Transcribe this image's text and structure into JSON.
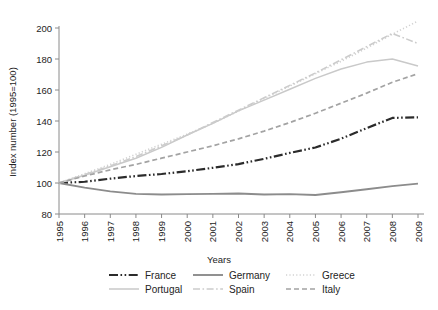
{
  "chart_data": {
    "type": "line",
    "title": "",
    "xlabel": "Years",
    "ylabel": "Index number (1995=100)",
    "x": [
      1995,
      1996,
      1997,
      1998,
      1999,
      2000,
      2001,
      2002,
      2003,
      2004,
      2005,
      2006,
      2007,
      2008,
      2009
    ],
    "xtick_labels": [
      "1995",
      "1996",
      "1997",
      "1998",
      "1999",
      "2000",
      "2001",
      "2002",
      "2003",
      "2004",
      "2005",
      "2006",
      "2007",
      "2008",
      "2009"
    ],
    "ytick_labels": [
      "80",
      "100",
      "120",
      "140",
      "160",
      "180",
      "200"
    ],
    "yticks": [
      80,
      100,
      120,
      140,
      160,
      180,
      200
    ],
    "xlim": [
      1995,
      2009
    ],
    "ylim": [
      80,
      206
    ],
    "grid": false,
    "legend_position": "bottom",
    "series": [
      {
        "name": "France",
        "color": "#2b2b2b",
        "width": 2.2,
        "dash": "9,2.5,1.6,2.5,1.6,2.5",
        "values": [
          100,
          100.8,
          102.8,
          104.5,
          105.8,
          107.6,
          109.8,
          112.2,
          115.6,
          119.4,
          122.9,
          128.6,
          135.4,
          142.0,
          142.4
        ]
      },
      {
        "name": "Germany",
        "color": "#8c8c8c",
        "width": 1.9,
        "dash": "",
        "values": [
          100,
          97.0,
          94.6,
          93.0,
          92.6,
          92.8,
          93.0,
          93.2,
          92.6,
          92.8,
          92.3,
          94.0,
          96.0,
          98.0,
          99.6
        ]
      },
      {
        "name": "Greece",
        "color": "#d2d2d2",
        "width": 1.6,
        "dash": "1.2,2.2",
        "values": [
          100,
          106.0,
          112.0,
          118.5,
          125.0,
          131.5,
          138.5,
          146.5,
          154.5,
          162.5,
          170.5,
          178.5,
          187.0,
          196.0,
          204.5
        ]
      },
      {
        "name": "Portugal",
        "color": "#c9c9c9",
        "width": 1.5,
        "dash": "",
        "values": [
          100,
          105.0,
          110.5,
          116.0,
          123.0,
          131.0,
          138.5,
          146.5,
          153.5,
          160.5,
          167.5,
          173.5,
          178.0,
          180.0,
          175.5
        ]
      },
      {
        "name": "Spain",
        "color": "#cccccc",
        "width": 1.6,
        "dash": "7,2.5,1.6,2.5",
        "values": [
          100,
          105.5,
          111.0,
          117.0,
          124.0,
          131.0,
          139.0,
          147.0,
          155.0,
          163.0,
          171.0,
          179.5,
          188.0,
          196.5,
          190.0
        ]
      },
      {
        "name": "Italy",
        "color": "#a3a3a3",
        "width": 1.7,
        "dash": "5,3",
        "values": [
          100,
          104.5,
          108.5,
          112.0,
          116.0,
          120.0,
          124.0,
          128.5,
          133.5,
          139.0,
          145.0,
          151.5,
          158.0,
          165.0,
          170.5
        ]
      }
    ],
    "legend_rows": [
      [
        "France",
        "Germany",
        "Greece"
      ],
      [
        "Portugal",
        "Spain",
        "Italy"
      ]
    ]
  }
}
